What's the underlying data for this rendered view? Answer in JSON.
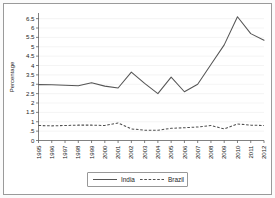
{
  "chart_data": {
    "type": "line",
    "title": "",
    "xlabel": "",
    "ylabel": "Percentage",
    "ylim": [
      0,
      6.8
    ],
    "yticks": [
      "0",
      ".5",
      "1",
      "1.5",
      "2",
      "2.5",
      "3",
      "3.5",
      "4",
      "4.5",
      "5",
      "5.5",
      "6",
      "6.5"
    ],
    "ytick_values": [
      0,
      0.5,
      1,
      1.5,
      2,
      2.5,
      3,
      3.5,
      4,
      4.5,
      5,
      5.5,
      6,
      6.5
    ],
    "grid": true,
    "legend_position": "bottom",
    "categories": [
      "1995",
      "1996",
      "1997",
      "1998",
      "1999",
      "2000",
      "2001",
      "2002",
      "2003",
      "2004",
      "2005",
      "2006",
      "2007",
      "2008",
      "2009",
      "2010",
      "2011",
      "2012"
    ],
    "series": [
      {
        "name": "India",
        "style": "solid",
        "color": "#555555",
        "values": [
          2.98,
          2.97,
          2.95,
          2.92,
          3.08,
          2.9,
          2.8,
          3.65,
          3.05,
          2.5,
          3.38,
          2.6,
          3.0,
          4.05,
          5.1,
          6.6,
          5.7,
          5.35
        ]
      },
      {
        "name": "Brazil",
        "style": "dashed",
        "color": "#4f4f4f",
        "values": [
          0.8,
          0.78,
          0.8,
          0.82,
          0.82,
          0.8,
          0.93,
          0.62,
          0.55,
          0.55,
          0.65,
          0.68,
          0.72,
          0.8,
          0.62,
          0.88,
          0.82,
          0.8
        ]
      }
    ]
  },
  "legend": {
    "india_label": "India",
    "brazil_label": "Brazil"
  },
  "axes": {
    "y_title": "Percentage"
  }
}
